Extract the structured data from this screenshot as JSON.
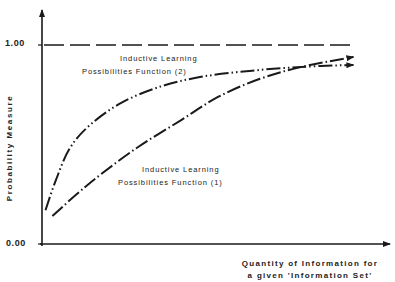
{
  "chart_data": {
    "type": "line",
    "title": "",
    "xlabel": "Quantity of Information for a given 'Information Set'",
    "xlabel_lines": [
      "Quantity of Information for",
      "a given 'Information Set'"
    ],
    "ylabel": "Probability Measure",
    "yticks": [
      "1.00",
      "0.00"
    ],
    "ylim": [
      0.0,
      1.0
    ],
    "xlim": [
      0,
      1
    ],
    "grid": false,
    "reference_line": {
      "y": 1.0,
      "style": "dashed",
      "label": "1.00"
    },
    "series": [
      {
        "name": "Inductive Learning Possibilities Function (1)",
        "label_lines": [
          "Inductive Learning",
          "Possibilities Function (1)"
        ],
        "style": "dash-dot",
        "x": [
          0.03,
          0.1,
          0.17,
          0.28,
          0.4,
          0.51,
          0.63,
          0.75,
          0.9
        ],
        "values": [
          0.14,
          0.25,
          0.35,
          0.49,
          0.62,
          0.74,
          0.83,
          0.89,
          0.94
        ]
      },
      {
        "name": "Inductive Learning Possibilities Function (2)",
        "label_lines": [
          "Inductive Learning",
          "Possibilities Function (2)"
        ],
        "style": "dash-dot-dot",
        "x": [
          0.01,
          0.04,
          0.08,
          0.14,
          0.23,
          0.34,
          0.46,
          0.6,
          0.75,
          0.9
        ],
        "values": [
          0.17,
          0.32,
          0.48,
          0.6,
          0.71,
          0.79,
          0.84,
          0.87,
          0.89,
          0.9
        ]
      }
    ],
    "annotations": [
      "Curves cross near x ≈ 0.67, y ≈ 0.88"
    ]
  },
  "labels": {
    "y_tick_top": "1.00",
    "y_tick_bottom": "0.00",
    "ylabel": "Probability Measure",
    "xlabel_line1": "Quantity of Information for",
    "xlabel_line2": "a given 'Information Set'",
    "f2_line1": "Inductive Learning",
    "f2_line2": "Possibilities Function (2)",
    "f1_line1": "Inductive Learning",
    "f1_line2": "Possibilities Function (1)"
  },
  "colors": {
    "ink": "#1a1a1a",
    "background": "#ffffff"
  }
}
